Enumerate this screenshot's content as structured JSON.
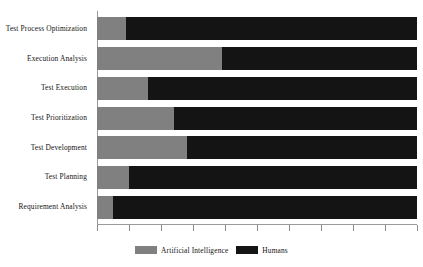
{
  "chart_data": {
    "type": "bar",
    "subtype": "stacked-horizontal-100",
    "title": "",
    "xlabel": "",
    "ylabel": "",
    "xlim": [
      0,
      100
    ],
    "grid": false,
    "legend_position": "bottom-center",
    "orientation": "horizontal",
    "categories": [
      "Test Process Optimization",
      "Execution Analysis",
      "Test Execution",
      "Test Prioritization",
      "Test Development",
      "Test Planning",
      "Requirement Analysis"
    ],
    "series": [
      {
        "name": "Artificial Intelligence",
        "color": "#808080",
        "values": [
          9,
          39,
          16,
          24,
          28,
          10,
          5
        ]
      },
      {
        "name": "Humans",
        "color": "#141414",
        "values": [
          91,
          61,
          84,
          76,
          72,
          90,
          95
        ]
      }
    ],
    "xtick_labels": [],
    "xtick_count": 11
  },
  "legend": {
    "entries": [
      {
        "label": "Artificial Intelligence",
        "color": "#808080",
        "swatch": "legend-swatch-ai"
      },
      {
        "label": "Humans",
        "color": "#141414",
        "swatch": "legend-swatch-human"
      }
    ]
  }
}
